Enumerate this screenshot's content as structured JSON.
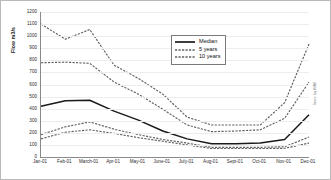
{
  "chart_data": {
    "type": "line",
    "title": "",
    "xlabel": "",
    "ylabel": "Flow m3/s",
    "ylim": [
      0,
      1200
    ],
    "ytick_step": 100,
    "yticks": [
      1200,
      1100,
      1000,
      900,
      800,
      700,
      600,
      500,
      400,
      300,
      200,
      100,
      0
    ],
    "grid": true,
    "legend_position": "upper-center-right",
    "categories": [
      "Jan-01",
      "Feb-01",
      "March-01",
      "Apr-01",
      "May-01",
      "June-01",
      "July-01",
      "Aug-01",
      "Sept-01",
      "Oct-01",
      "Nov-01",
      "Dec-01"
    ],
    "series": [
      {
        "name": "10 years upper",
        "legend": "10 years",
        "style": "dashed",
        "color": "#606060",
        "values": [
          1100,
          975,
          1055,
          760,
          650,
          520,
          330,
          265,
          265,
          265,
          450,
          935
        ]
      },
      {
        "name": "5 years upper",
        "legend": "5 years",
        "style": "dashed",
        "color": "#606060",
        "values": [
          780,
          785,
          775,
          620,
          520,
          395,
          265,
          210,
          215,
          225,
          320,
          620
        ]
      },
      {
        "name": "Median",
        "legend": "Median",
        "style": "solid",
        "color": "#1a1a1a",
        "values": [
          420,
          465,
          470,
          380,
          305,
          215,
          150,
          110,
          110,
          115,
          145,
          350
        ]
      },
      {
        "name": "5 years lower",
        "legend": "5 years",
        "style": "dashed",
        "color": "#606060",
        "values": [
          185,
          250,
          290,
          230,
          185,
          145,
          115,
          80,
          80,
          80,
          85,
          165
        ]
      },
      {
        "name": "10 years lower",
        "legend": "10 years",
        "style": "dashed",
        "color": "#606060",
        "values": [
          150,
          205,
          225,
          195,
          160,
          130,
          100,
          70,
          70,
          70,
          72,
          115
        ]
      }
    ],
    "legend_entries": [
      {
        "label": "Median",
        "style": "solid",
        "color": "#1a1a1a"
      },
      {
        "label": "5 years",
        "style": "dashed",
        "color": "#606060"
      },
      {
        "label": "10 years",
        "style": "dashed",
        "color": "#606060"
      }
    ],
    "source_note": "Source: Iraq MoWR"
  }
}
